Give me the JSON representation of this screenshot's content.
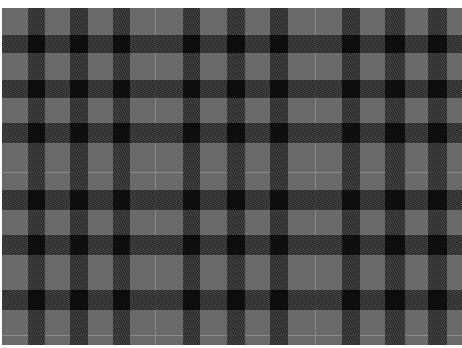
{
  "image": {
    "description": "Grey and black tartan plaid fabric pattern",
    "colors": {
      "base": "#6a6a6a",
      "band": "#2a2a2a",
      "intersection": "#0e0e0e",
      "light_line": "#8a8a8a",
      "border": "#ffffff"
    },
    "vertical_bands": [
      [
        28,
        45
      ],
      [
        70,
        88
      ],
      [
        113,
        130
      ],
      [
        183,
        200
      ],
      [
        227,
        245
      ],
      [
        270,
        288
      ],
      [
        342,
        360
      ],
      [
        385,
        405
      ],
      [
        428,
        447
      ]
    ],
    "horizontal_bands": [
      [
        35,
        53
      ],
      [
        80,
        98
      ],
      [
        123,
        143
      ],
      [
        190,
        210
      ],
      [
        235,
        255
      ],
      [
        290,
        310
      ]
    ],
    "vertical_light_lines": [
      155,
      315
    ],
    "horizontal_light_lines": [
      172,
      335
    ]
  }
}
